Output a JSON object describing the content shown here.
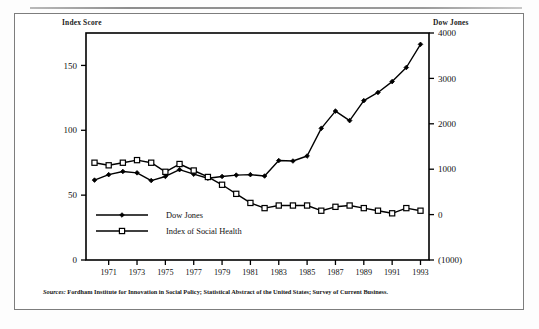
{
  "figure": {
    "left_axis_title": "Index Score",
    "right_axis_title": "Dow Jones",
    "source_prefix": "Sources:",
    "source_text": " Fordham Institute for Innovation in Social Policy; Statistical Abstract of the United States; Survey of Current Business."
  },
  "legend": {
    "items": [
      {
        "label": "Dow Jones",
        "marker": "filled-diamond",
        "color": "#000000"
      },
      {
        "label": "Index of Social Health",
        "marker": "open-square",
        "color": "#000000"
      }
    ]
  },
  "chart_data": {
    "type": "line",
    "title": "",
    "subtitle": "",
    "xlabel": "",
    "ylabel": "Index Score",
    "y2label": "Dow Jones",
    "grid": false,
    "legend_position": "inside-bottom-left",
    "x": [
      1970,
      1971,
      1972,
      1973,
      1974,
      1975,
      1976,
      1977,
      1978,
      1979,
      1980,
      1981,
      1982,
      1983,
      1984,
      1985,
      1986,
      1987,
      1988,
      1989,
      1990,
      1991,
      1992,
      1993
    ],
    "xtick_labels": [
      "1971",
      "1973",
      "1975",
      "1977",
      "1979",
      "1981",
      "1983",
      "1985",
      "1987",
      "1989",
      "1991",
      "1993"
    ],
    "xticks": [
      1971,
      1973,
      1975,
      1977,
      1979,
      1981,
      1983,
      1985,
      1987,
      1989,
      1991,
      1993
    ],
    "xlim": [
      1969.4,
      1993.6
    ],
    "ylim": [
      0,
      175
    ],
    "yticks": [
      0,
      50,
      100,
      150
    ],
    "ytick_labels": [
      "0",
      "50",
      "100",
      "150"
    ],
    "y2lim": [
      -1000,
      4000
    ],
    "y2ticks": [
      -1000,
      0,
      1000,
      2000,
      3000,
      4000
    ],
    "y2tick_labels": [
      "(1000)",
      "0",
      "1000",
      "2000",
      "3000",
      "4000"
    ],
    "series": [
      {
        "name": "Dow Jones",
        "axis": "right",
        "marker": "filled-diamond",
        "color": "#000000",
        "values": [
          760,
          880,
          950,
          920,
          750,
          840,
          990,
          890,
          800,
          840,
          870,
          880,
          850,
          1190,
          1180,
          1290,
          1900,
          2280,
          2070,
          2510,
          2690,
          2930,
          3240,
          3750
        ]
      },
      {
        "name": "Index of Social Health",
        "axis": "left",
        "marker": "open-square",
        "color": "#000000",
        "values": [
          75,
          73,
          75,
          77,
          75,
          68,
          74,
          69,
          64,
          58,
          51,
          44,
          40,
          42,
          42,
          42,
          38,
          41,
          42,
          40,
          38,
          36,
          40,
          38
        ]
      }
    ]
  }
}
